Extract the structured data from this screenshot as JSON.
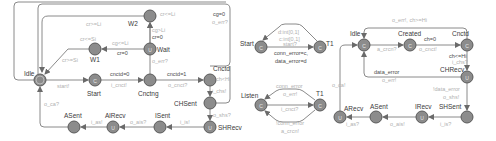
{
  "colors": {
    "edge": "#8a8a8a",
    "node": "#8c8c8c",
    "location_label": "#3a3a3a",
    "guard_label": "#b0b0b0",
    "update_label": "#4a4a4a"
  },
  "diagrams": [
    {
      "name": "client",
      "locations": [
        {
          "id": "Idle",
          "label": "Idle",
          "x": 40,
          "y": 80,
          "mark": "init",
          "lx": 24,
          "ly": 76
        },
        {
          "id": "W2",
          "label": "W2",
          "x": 150,
          "y": 16,
          "mark": "",
          "lx": 128,
          "ly": 26
        },
        {
          "id": "W1",
          "label": "W1",
          "x": 95,
          "y": 49,
          "mark": "",
          "lx": 90,
          "ly": 62
        },
        {
          "id": "Wait",
          "label": "Wait",
          "x": 150,
          "y": 49,
          "mark": "U",
          "lx": 157,
          "ly": 52
        },
        {
          "id": "Start",
          "label": "Start",
          "x": 95,
          "y": 80,
          "mark": "C",
          "lx": 87,
          "ly": 96
        },
        {
          "id": "Cnctng",
          "label": "Cnctng",
          "x": 150,
          "y": 80,
          "mark": "",
          "lx": 138,
          "ly": 96
        },
        {
          "id": "Cnctd",
          "label": "Cnctd",
          "x": 210,
          "y": 80,
          "mark": "",
          "lx": 213,
          "ly": 71
        },
        {
          "id": "CHSent",
          "label": "CHSent",
          "x": 210,
          "y": 103,
          "mark": "",
          "lx": 174,
          "ly": 106
        },
        {
          "id": "SHRecv",
          "label": "SHRecv",
          "x": 210,
          "y": 127,
          "mark": "U",
          "lx": 218,
          "ly": 130
        },
        {
          "id": "ISent",
          "label": "ISent",
          "x": 160,
          "y": 127,
          "mark": "",
          "lx": 155,
          "ly": 118
        },
        {
          "id": "AlRecv",
          "label": "AlRecv",
          "x": 113,
          "y": 127,
          "mark": "U",
          "lx": 105,
          "ly": 118
        },
        {
          "id": "ASent",
          "label": "ASent",
          "x": 74,
          "y": 127,
          "mark": "",
          "lx": 64,
          "ly": 118
        }
      ],
      "texts": [
        {
          "t": "cr<=Li",
          "x": 160,
          "y": 16,
          "k": "grd"
        },
        {
          "t": "cr>=Li",
          "x": 86,
          "y": 26,
          "k": "grd"
        },
        {
          "t": "cr<=Si",
          "x": 80,
          "y": 41,
          "k": "grd"
        },
        {
          "t": "cg<=Li",
          "x": 112,
          "y": 45,
          "k": "grd"
        },
        {
          "t": "cr=0",
          "x": 117,
          "y": 55,
          "k": "upd"
        },
        {
          "t": "cg>Li",
          "x": 152,
          "y": 32,
          "k": "grd"
        },
        {
          "t": "cr=0",
          "x": 152,
          "y": 39,
          "k": "upd"
        },
        {
          "t": "cr>=Si",
          "x": 62,
          "y": 62,
          "k": "grd"
        },
        {
          "t": "o_err?",
          "x": 152,
          "y": 63,
          "k": "grd"
        },
        {
          "t": "start!",
          "x": 57,
          "y": 88,
          "k": "grd"
        },
        {
          "t": "cnctd=0",
          "x": 110,
          "y": 76,
          "k": "upd"
        },
        {
          "t": "i_cnct!",
          "x": 111,
          "y": 87,
          "k": "grd"
        },
        {
          "t": "cnctd=1",
          "x": 167,
          "y": 76,
          "k": "upd"
        },
        {
          "t": "o_cnct?",
          "x": 168,
          "y": 87,
          "k": "grd"
        },
        {
          "t": "ch<Hi",
          "x": 216,
          "y": 81,
          "k": "grd"
        },
        {
          "t": "i_chs!",
          "x": 212,
          "y": 93,
          "k": "grd"
        },
        {
          "t": "o_shs?",
          "x": 213,
          "y": 117,
          "k": "grd"
        },
        {
          "t": "cg=0",
          "x": 213,
          "y": 16,
          "k": "upd"
        },
        {
          "t": "o_err?",
          "x": 212,
          "y": 24,
          "k": "grd"
        },
        {
          "t": "i_is!",
          "x": 180,
          "y": 124,
          "k": "grd"
        },
        {
          "t": "o_ais?",
          "x": 130,
          "y": 124,
          "k": "grd"
        },
        {
          "t": "i_as!",
          "x": 91,
          "y": 124,
          "k": "grd"
        },
        {
          "t": "o_ca?",
          "x": 44,
          "y": 106,
          "k": "grd"
        }
      ]
    },
    {
      "name": "channel-1",
      "locations": [
        {
          "id": "Start",
          "label": "Start",
          "x": 261,
          "y": 47,
          "mark": "C",
          "lx": 240,
          "ly": 46
        },
        {
          "id": "T1",
          "label": "T1",
          "x": 320,
          "y": 47,
          "mark": "C",
          "lx": 326,
          "ly": 46
        }
      ],
      "texts": [
        {
          "t": "d:int[0,1]",
          "x": 278,
          "y": 34,
          "k": "grd"
        },
        {
          "t": "c:int[0,1]",
          "x": 279,
          "y": 41,
          "k": "grd"
        },
        {
          "t": "start?",
          "x": 283,
          "y": 46,
          "k": "grd"
        },
        {
          "t": "conn_error=c,",
          "x": 274,
          "y": 55,
          "k": "upd"
        },
        {
          "t": "data_error=d",
          "x": 275,
          "y": 63,
          "k": "upd"
        }
      ]
    },
    {
      "name": "channel-2",
      "locations": [
        {
          "id": "Listen",
          "label": "Listen",
          "x": 261,
          "y": 105,
          "mark": "C",
          "lx": 241,
          "ly": 98
        },
        {
          "id": "T1b",
          "label": "T1",
          "x": 320,
          "y": 105,
          "mark": "C",
          "lx": 316,
          "ly": 96
        }
      ],
      "texts": [
        {
          "t": "conn_error",
          "x": 276,
          "y": 88,
          "k": "grd"
        },
        {
          "t": "o_err!",
          "x": 283,
          "y": 96,
          "k": "grd"
        },
        {
          "t": "i_cnct?",
          "x": 281,
          "y": 111,
          "k": "grd"
        },
        {
          "t": "!conn_error",
          "x": 276,
          "y": 125,
          "k": "grd"
        },
        {
          "t": "a_crcn!",
          "x": 281,
          "y": 133,
          "k": "grd"
        }
      ]
    },
    {
      "name": "server",
      "locations": [
        {
          "id": "Idle",
          "label": "Idle",
          "x": 364,
          "y": 45,
          "mark": "C",
          "lx": 350,
          "ly": 36
        },
        {
          "id": "Created",
          "label": "Created",
          "x": 410,
          "y": 45,
          "mark": "C",
          "lx": 398,
          "ly": 36
        },
        {
          "id": "Cnctd",
          "label": "Cnctd",
          "x": 467,
          "y": 45,
          "mark": "C",
          "lx": 452,
          "ly": 36
        },
        {
          "id": "CHRecv",
          "label": "CHRecv",
          "x": 467,
          "y": 77,
          "mark": "U",
          "lx": 440,
          "ly": 72
        },
        {
          "id": "SHSent",
          "label": "SHSent",
          "x": 467,
          "y": 117,
          "mark": "",
          "lx": 439,
          "ly": 109
        },
        {
          "id": "IRecv",
          "label": "IRecv",
          "x": 422,
          "y": 117,
          "mark": "U",
          "lx": 415,
          "ly": 109
        },
        {
          "id": "ASent",
          "label": "ASent",
          "x": 376,
          "y": 117,
          "mark": "",
          "lx": 370,
          "ly": 109
        },
        {
          "id": "ARecv",
          "label": "ARecv",
          "x": 340,
          "y": 117,
          "mark": "U",
          "lx": 344,
          "ly": 111
        }
      ],
      "texts": [
        {
          "t": "o_err!, ch>=Hi",
          "x": 392,
          "y": 22,
          "k": "grd"
        },
        {
          "t": "ch=0",
          "x": 424,
          "y": 41,
          "k": "upd"
        },
        {
          "t": "a_crcn?",
          "x": 377,
          "y": 51,
          "k": "grd"
        },
        {
          "t": "o_cnct!",
          "x": 419,
          "y": 51,
          "k": "grd"
        },
        {
          "t": "ch<=Hi",
          "x": 449,
          "y": 58,
          "k": "upd"
        },
        {
          "t": "i_chs?",
          "x": 452,
          "y": 64,
          "k": "grd"
        },
        {
          "t": "data_error",
          "x": 374,
          "y": 74,
          "k": "upd"
        },
        {
          "t": "o_err!",
          "x": 382,
          "y": 82,
          "k": "grd"
        },
        {
          "t": "!data_error",
          "x": 433,
          "y": 91,
          "k": "grd"
        },
        {
          "t": "o_shs!",
          "x": 443,
          "y": 99,
          "k": "grd"
        },
        {
          "t": "o_ca!",
          "x": 332,
          "y": 87,
          "k": "grd"
        },
        {
          "t": "i_is?",
          "x": 440,
          "y": 126,
          "k": "grd"
        },
        {
          "t": "o_ais!",
          "x": 390,
          "y": 126,
          "k": "grd"
        },
        {
          "t": "i_as?",
          "x": 346,
          "y": 126,
          "k": "grd"
        }
      ]
    }
  ]
}
